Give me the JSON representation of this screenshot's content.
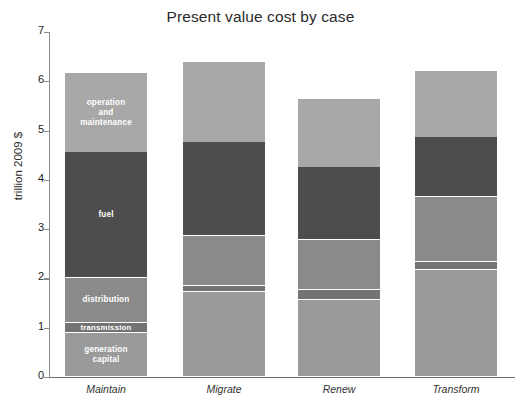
{
  "chart_data": {
    "type": "bar",
    "subtype": "stacked-vertical",
    "title": "Present value cost by case",
    "xlabel": "",
    "ylabel": "trillion 2009 $",
    "ylim": [
      0,
      7
    ],
    "yticks": [
      0,
      1,
      2,
      3,
      4,
      5,
      6,
      7
    ],
    "ytick_labels": [
      "0",
      "1",
      "2",
      "3",
      "4",
      "5",
      "6",
      "7"
    ],
    "grid": false,
    "legend": "none (series labeled in-place on first bar)",
    "categories": [
      "Maintain",
      "Migrate",
      "Renew",
      "Transform"
    ],
    "series": [
      {
        "name": "generation capital",
        "label": "generation\ncapital",
        "color": "#9a9a9a",
        "values": [
          0.89,
          1.72,
          1.56,
          2.17
        ]
      },
      {
        "name": "transmission",
        "label": "transmission",
        "color": "#737373",
        "values": [
          0.21,
          0.13,
          0.2,
          0.16
        ]
      },
      {
        "name": "distribution",
        "label": "distribution",
        "color": "#8a8a8a",
        "values": [
          0.91,
          1.01,
          1.02,
          1.32
        ]
      },
      {
        "name": "fuel",
        "label": "fuel",
        "color": "#4d4d4d",
        "values": [
          2.55,
          1.91,
          1.48,
          1.22
        ]
      },
      {
        "name": "operation and maintenance",
        "label": "operation\nand\nmaintenance",
        "color": "#a8a8a8",
        "values": [
          1.6,
          1.62,
          1.38,
          1.34
        ]
      }
    ],
    "totals": [
      6.16,
      6.39,
      5.64,
      6.21
    ]
  },
  "labeled_bar_index": 0,
  "axis_color": "#8c8c8c",
  "title_color": "#2b2b2b"
}
